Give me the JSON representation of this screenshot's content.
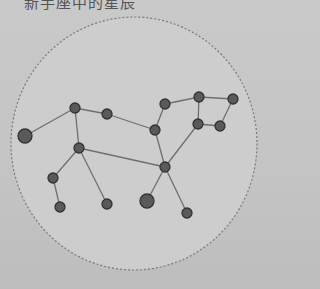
{
  "caption": "新手座中的星辰",
  "colors": {
    "background": "#c6c6c6",
    "circle_fill": "#cdcdcd",
    "circle_stroke": "#7a7a7a",
    "edge": "#6f6f6f",
    "node_fill": "#5a5a5a",
    "node_stroke": "#333333"
  },
  "boundary": {
    "cx": 134,
    "cy": 143.5,
    "rx": 123,
    "ry": 126.5
  },
  "nodes": [
    {
      "id": "A",
      "x": 25,
      "y": 136,
      "r": 7
    },
    {
      "id": "B",
      "x": 75,
      "y": 108,
      "r": 5
    },
    {
      "id": "C",
      "x": 107,
      "y": 114,
      "r": 5
    },
    {
      "id": "D",
      "x": 79,
      "y": 148,
      "r": 5
    },
    {
      "id": "E",
      "x": 53,
      "y": 178,
      "r": 5
    },
    {
      "id": "F",
      "x": 60,
      "y": 207,
      "r": 5
    },
    {
      "id": "G",
      "x": 107,
      "y": 204,
      "r": 5
    },
    {
      "id": "H",
      "x": 155,
      "y": 130,
      "r": 5
    },
    {
      "id": "I",
      "x": 165,
      "y": 104,
      "r": 5
    },
    {
      "id": "J",
      "x": 199,
      "y": 97,
      "r": 5
    },
    {
      "id": "K",
      "x": 233,
      "y": 99,
      "r": 5
    },
    {
      "id": "L",
      "x": 198,
      "y": 124,
      "r": 5
    },
    {
      "id": "M",
      "x": 220,
      "y": 126,
      "r": 5
    },
    {
      "id": "N",
      "x": 165,
      "y": 167,
      "r": 5
    },
    {
      "id": "O",
      "x": 147,
      "y": 201,
      "r": 7
    },
    {
      "id": "P",
      "x": 187,
      "y": 213,
      "r": 5
    }
  ],
  "edges": [
    [
      "A",
      "B"
    ],
    [
      "B",
      "C"
    ],
    [
      "B",
      "D"
    ],
    [
      "C",
      "H"
    ],
    [
      "H",
      "I"
    ],
    [
      "I",
      "J"
    ],
    [
      "J",
      "K"
    ],
    [
      "J",
      "L"
    ],
    [
      "K",
      "M"
    ],
    [
      "L",
      "M"
    ],
    [
      "H",
      "N"
    ],
    [
      "L",
      "N"
    ],
    [
      "D",
      "N"
    ],
    [
      "D",
      "E"
    ],
    [
      "E",
      "F"
    ],
    [
      "D",
      "G"
    ],
    [
      "N",
      "O"
    ],
    [
      "N",
      "P"
    ]
  ]
}
